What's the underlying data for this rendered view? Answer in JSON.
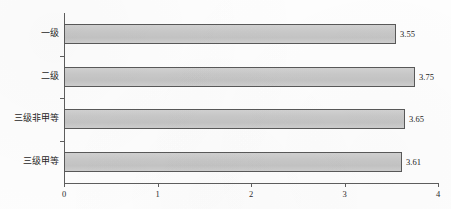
{
  "chart_data": {
    "type": "bar",
    "orientation": "horizontal",
    "title": "",
    "subtitle": "",
    "xlabel": "",
    "ylabel": "",
    "categories": [
      "一级",
      "二级",
      "三级非甲等",
      "三级甲等"
    ],
    "values": [
      3.55,
      3.75,
      3.65,
      3.61
    ],
    "value_labels": [
      "3.55",
      "3.75",
      "3.65",
      "3.61"
    ],
    "xlim": [
      0,
      4
    ],
    "xticks": [
      0,
      1,
      2,
      3,
      4
    ],
    "xtick_labels": [
      "0",
      "1",
      "2",
      "3",
      "4"
    ],
    "grid": false,
    "legend": null,
    "legend_position": "none",
    "annotations": [],
    "colors": {
      "bar_fill": "#c9c9c9",
      "bar_border": "#595959",
      "axis": "#5e5e5e",
      "text": "#1f1f1f",
      "background": "#fefefe"
    }
  }
}
